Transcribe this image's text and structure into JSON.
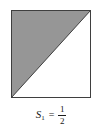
{
  "figure": {
    "background_color": "#ffffff",
    "square": {
      "name": "unit-square",
      "border_color": "#3f3f3f",
      "border_width_px": 1,
      "fill_unshaded_color": "#ffffff",
      "shaded_region": {
        "label": "upper-left-triangle",
        "fill_color": "#969696",
        "vertices": "bottom-left, top-left, top-right"
      },
      "diagonal": {
        "label": "diagonal-bottom-left-to-top-right",
        "color": "#3f3f3f"
      }
    },
    "caption": {
      "symbol": "S",
      "subscript": "1",
      "equals": "=",
      "fraction_numerator": "1",
      "fraction_denominator": "2",
      "full_text": "S₁ = 1/2"
    }
  }
}
